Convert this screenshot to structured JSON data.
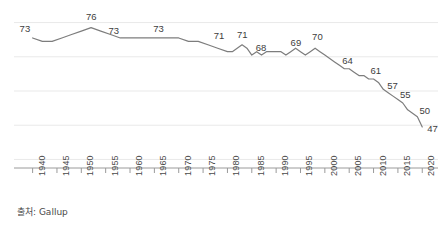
{
  "source_note": "출처: Gallup",
  "chart_data": {
    "type": "line",
    "title": "",
    "subtitle": "",
    "xlabel": "",
    "ylabel": "",
    "grid": true,
    "legend": false,
    "legend_position": "none",
    "line_color": "#7d7d7d",
    "grid_color": "#e9e9e9",
    "axis_color": "#9a9a9a",
    "label_color": "#3d3d3d",
    "xlim": [
      1937,
      2022
    ],
    "ylim": [
      35,
      80
    ],
    "xticks": [
      "1940",
      "1945",
      "1950",
      "1955",
      "1960",
      "1965",
      "1970",
      "1975",
      "1980",
      "1985",
      "1990",
      "1995",
      "2000",
      "2005",
      "2010",
      "2015",
      "2020"
    ],
    "yticks": [],
    "x": [
      1940,
      1942,
      1944,
      1946,
      1948,
      1950,
      1952,
      1954,
      1956,
      1958,
      1960,
      1962,
      1964,
      1966,
      1968,
      1970,
      1972,
      1974,
      1976,
      1978,
      1980,
      1981,
      1982,
      1983,
      1984,
      1985,
      1986,
      1987,
      1988,
      1989,
      1990,
      1991,
      1992,
      1993,
      1994,
      1995,
      1996,
      1997,
      1998,
      1999,
      2000,
      2001,
      2002,
      2003,
      2004,
      2005,
      2006,
      2007,
      2008,
      2009,
      2010,
      2011,
      2012,
      2013,
      2014,
      2015,
      2016,
      2017,
      2018,
      2019,
      2020
    ],
    "values": [
      73,
      72,
      72,
      73,
      74,
      75,
      76,
      75,
      74,
      73,
      73,
      73,
      73,
      73,
      73,
      73,
      72,
      72,
      71,
      70,
      69,
      69,
      70,
      71,
      70,
      68,
      69,
      68,
      69,
      69,
      69,
      69,
      68,
      69,
      70,
      69,
      68,
      69,
      70,
      69,
      68,
      67,
      66,
      65,
      64,
      64,
      63,
      62,
      62,
      61,
      61,
      60,
      58,
      57,
      56,
      55,
      54,
      52,
      51,
      50,
      47
    ],
    "labeled_points": [
      {
        "year": 1940,
        "value": 73,
        "label": "73"
      },
      {
        "year": 1952,
        "value": 76,
        "label": "76"
      },
      {
        "year": 1956,
        "value": 73,
        "label": "73"
      },
      {
        "year": 1966,
        "value": 73,
        "label": "73"
      },
      {
        "year": 1978,
        "value": 71,
        "label": "71"
      },
      {
        "year": 1983,
        "value": 71,
        "label": "71"
      },
      {
        "year": 1986,
        "value": 68,
        "label": "68"
      },
      {
        "year": 1994,
        "value": 69,
        "label": "69"
      },
      {
        "year": 1998,
        "value": 70,
        "label": "70"
      },
      {
        "year": 2004,
        "value": 64,
        "label": "64"
      },
      {
        "year": 2010,
        "value": 61,
        "label": "61"
      },
      {
        "year": 2013,
        "value": 57,
        "label": "57"
      },
      {
        "year": 2015,
        "value": 55,
        "label": "55"
      },
      {
        "year": 2019,
        "value": 50,
        "label": "50"
      },
      {
        "year": 2020,
        "value": 47,
        "label": "47"
      }
    ],
    "gridline_values": [
      77.5,
      67.5,
      57.5,
      47.5,
      37.5
    ]
  }
}
